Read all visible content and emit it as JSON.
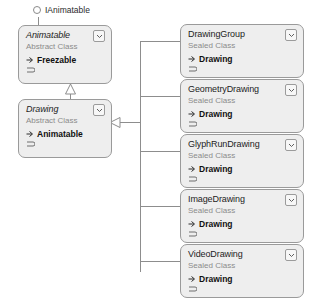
{
  "diagram": {
    "type": "uml-class-diagram",
    "background_color": "#ffffff",
    "shape_fill": "#eeeeee",
    "shape_border": "#9a9a9a",
    "connector_color": "#8d8d8d"
  },
  "interface": {
    "label": "IAnimatable",
    "icon": "lollipop-circle-icon"
  },
  "left_column": [
    {
      "name": "Animatable",
      "stereotype": "Abstract Class",
      "abstract": true,
      "member_glyph": "base-class-arrow-icon",
      "member": "Freezable",
      "chevron": "chevron-down-icon",
      "handle": "resize-handle-icon"
    },
    {
      "name": "Drawing",
      "stereotype": "Abstract Class",
      "abstract": true,
      "member_glyph": "base-class-arrow-icon",
      "member": "Animatable",
      "chevron": "chevron-down-icon",
      "handle": "resize-handle-icon"
    }
  ],
  "right_column": [
    {
      "name": "DrawingGroup",
      "stereotype": "Sealed Class",
      "abstract": false,
      "member_glyph": "base-class-arrow-icon",
      "member": "Drawing",
      "chevron": "chevron-down-icon",
      "handle": "resize-handle-icon"
    },
    {
      "name": "GeometryDrawing",
      "stereotype": "Sealed Class",
      "abstract": false,
      "member_glyph": "base-class-arrow-icon",
      "member": "Drawing",
      "chevron": "chevron-down-icon",
      "handle": "resize-handle-icon"
    },
    {
      "name": "GlyphRunDrawing",
      "stereotype": "Sealed Class",
      "abstract": false,
      "member_glyph": "base-class-arrow-icon",
      "member": "Drawing",
      "chevron": "chevron-down-icon",
      "handle": "resize-handle-icon"
    },
    {
      "name": "ImageDrawing",
      "stereotype": "Sealed Class",
      "abstract": false,
      "member_glyph": "base-class-arrow-icon",
      "member": "Drawing",
      "chevron": "chevron-down-icon",
      "handle": "resize-handle-icon"
    },
    {
      "name": "VideoDrawing",
      "stereotype": "Sealed Class",
      "abstract": false,
      "member_glyph": "base-class-arrow-icon",
      "member": "Drawing",
      "chevron": "chevron-down-icon",
      "handle": "resize-handle-icon"
    }
  ],
  "relationships": [
    {
      "kind": "generalization",
      "from": "Drawing",
      "to": "Animatable"
    },
    {
      "kind": "generalization",
      "from": "DrawingGroup",
      "to": "Drawing"
    },
    {
      "kind": "generalization",
      "from": "GeometryDrawing",
      "to": "Drawing"
    },
    {
      "kind": "generalization",
      "from": "GlyphRunDrawing",
      "to": "Drawing"
    },
    {
      "kind": "generalization",
      "from": "ImageDrawing",
      "to": "Drawing"
    },
    {
      "kind": "generalization",
      "from": "VideoDrawing",
      "to": "Drawing"
    },
    {
      "kind": "realization",
      "from": "Animatable",
      "to": "IAnimatable"
    }
  ]
}
